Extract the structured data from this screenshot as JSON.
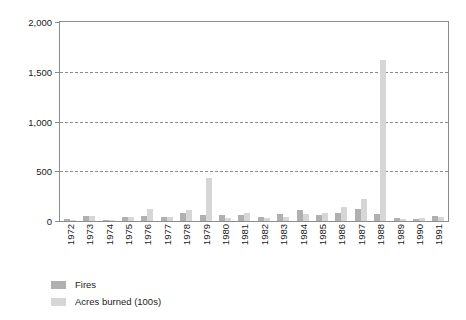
{
  "chart_data": {
    "type": "bar",
    "title": "",
    "subtitle": "",
    "xlabel": "",
    "ylabel": "",
    "ylim": [
      0,
      2000
    ],
    "yticks": [
      0,
      500,
      1000,
      1500,
      2000
    ],
    "ytick_labels": [
      "0",
      "500",
      "1,000",
      "1,500",
      "2,000"
    ],
    "grid": true,
    "gridlines_at": [
      500,
      1000,
      1500
    ],
    "legend_position": "below-left",
    "categories": [
      "1972",
      "1973",
      "1974",
      "1975",
      "1976",
      "1977",
      "1978",
      "1979",
      "1980",
      "1981",
      "1982",
      "1983",
      "1984",
      "1985",
      "1986",
      "1987",
      "1988",
      "1989",
      "1990",
      "1991"
    ],
    "series": [
      {
        "name": "Fires",
        "color": "#b0b0b0",
        "values": [
          18,
          48,
          15,
          42,
          55,
          45,
          80,
          62,
          62,
          60,
          45,
          70,
          115,
          60,
          80,
          120,
          72,
          30,
          25,
          52
        ]
      },
      {
        "name": "Acres burned (100s)",
        "color": "#d6d6d6",
        "values": [
          10,
          52,
          12,
          38,
          118,
          38,
          108,
          428,
          30,
          78,
          32,
          45,
          68,
          85,
          140,
          222,
          1620,
          18,
          30,
          45
        ]
      }
    ]
  },
  "axes": {
    "y_tick_labels": [
      "2,000",
      "1,500",
      "1,000",
      "500",
      "0"
    ]
  },
  "legend": {
    "items": [
      {
        "label": "Fires",
        "color": "#b0b0b0"
      },
      {
        "label": "Acres burned (100s)",
        "color": "#d6d6d6"
      }
    ]
  }
}
